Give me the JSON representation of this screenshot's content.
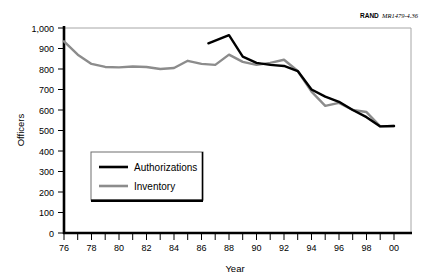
{
  "source_note": {
    "brand": "RAND",
    "identifier": "MR1479-4.36"
  },
  "chart_data": {
    "type": "line",
    "title": "",
    "xlabel": "Year",
    "ylabel": "Officers",
    "xlim": [
      76,
      100
    ],
    "ylim": [
      0,
      1000
    ],
    "y_ticks": [
      "0",
      "100",
      "200",
      "300",
      "400",
      "500",
      "600",
      "700",
      "800",
      "900",
      "1,000"
    ],
    "y_tick_values": [
      0,
      100,
      200,
      300,
      400,
      500,
      600,
      700,
      800,
      900,
      1000
    ],
    "x_ticks": [
      "76",
      "78",
      "80",
      "82",
      "84",
      "86",
      "88",
      "90",
      "92",
      "94",
      "96",
      "98",
      "00"
    ],
    "x_tick_values": [
      76,
      78,
      80,
      82,
      84,
      86,
      88,
      90,
      92,
      94,
      96,
      98,
      100
    ],
    "x_minor_step": 1,
    "grid": false,
    "legend_position": "center-left",
    "colors": {
      "authorizations": "#000000",
      "inventory": "#8c8c8c",
      "axis": "#000000",
      "frame": "#a6a6a6",
      "background": "#ffffff"
    },
    "series": [
      {
        "name": "Authorizations",
        "color": "#000000",
        "x": [
          86.5,
          88,
          89,
          90,
          91,
          92,
          93,
          94,
          95,
          96,
          97,
          98,
          99,
          100
        ],
        "values": [
          925,
          965,
          860,
          830,
          820,
          815,
          790,
          700,
          665,
          640,
          600,
          565,
          520,
          522
        ]
      },
      {
        "name": "Inventory",
        "color": "#8c8c8c",
        "x": [
          76,
          77,
          78,
          79,
          80,
          81,
          82,
          83,
          84,
          85,
          86,
          87,
          88,
          89,
          90,
          91,
          92,
          93,
          94,
          95,
          96,
          97,
          98,
          99,
          100
        ],
        "values": [
          935,
          870,
          825,
          810,
          808,
          812,
          810,
          800,
          805,
          840,
          825,
          820,
          870,
          835,
          820,
          830,
          845,
          790,
          690,
          620,
          635,
          600,
          590,
          520,
          522
        ]
      }
    ]
  }
}
